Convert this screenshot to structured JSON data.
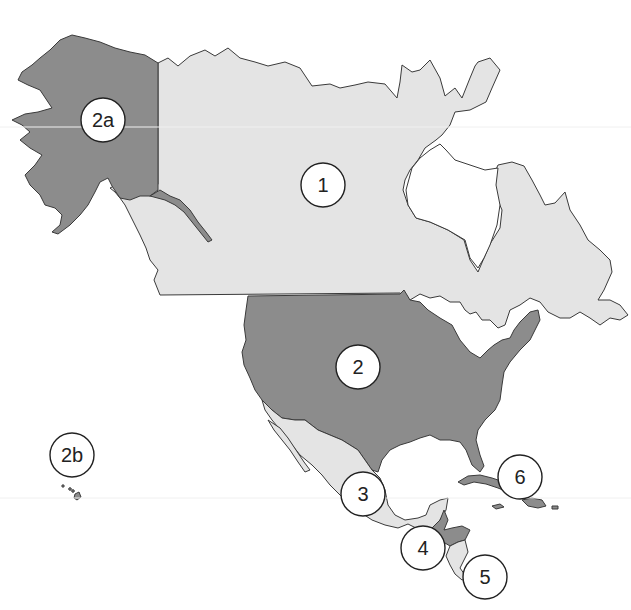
{
  "map": {
    "subject": "North America political regions",
    "colors": {
      "light_region": "#e4e4e4",
      "dark_region": "#8c8c8c",
      "outline": "#3a3a3a",
      "background": "#ffffff"
    },
    "regions": [
      {
        "id": "canada",
        "name": "Canada",
        "shade": "light",
        "label": "1"
      },
      {
        "id": "usa",
        "name": "United States (contiguous)",
        "shade": "dark",
        "label": "2"
      },
      {
        "id": "alaska",
        "name": "Alaska",
        "shade": "dark",
        "label": "2a"
      },
      {
        "id": "hawaii",
        "name": "Hawaii",
        "shade": "dark",
        "label": "2b"
      },
      {
        "id": "mexico",
        "name": "Mexico",
        "shade": "light",
        "label": "3"
      },
      {
        "id": "central-america-north",
        "name": "Central America (Guatemala, Belize, Honduras, El Salvador)",
        "shade": "dark",
        "label": "4"
      },
      {
        "id": "central-america-south",
        "name": "Central America (Nicaragua, Costa Rica, Panama)",
        "shade": "light",
        "label": "5"
      },
      {
        "id": "caribbean",
        "name": "Caribbean islands",
        "shade": "dark",
        "label": "6"
      }
    ],
    "markers": [
      {
        "label": "1",
        "region": "canada"
      },
      {
        "label": "2",
        "region": "usa"
      },
      {
        "label": "2a",
        "region": "alaska"
      },
      {
        "label": "2b",
        "region": "hawaii"
      },
      {
        "label": "3",
        "region": "mexico"
      },
      {
        "label": "4",
        "region": "central-america-north"
      },
      {
        "label": "5",
        "region": "central-america-south"
      },
      {
        "label": "6",
        "region": "caribbean"
      }
    ]
  }
}
